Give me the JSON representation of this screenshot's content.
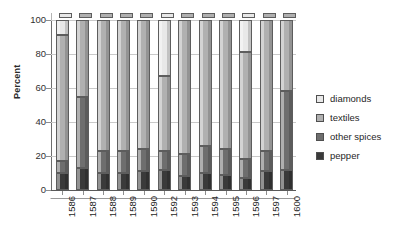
{
  "chart_data": {
    "type": "bar",
    "stacked": true,
    "title": "",
    "xlabel": "",
    "ylabel": "Percent",
    "ylim": [
      0,
      100
    ],
    "yticks": [
      0,
      20,
      40,
      60,
      80,
      100
    ],
    "grid": true,
    "legend_position": "right",
    "categories": [
      "1586",
      "1587",
      "1588",
      "1589",
      "1590",
      "1592",
      "1593",
      "1594",
      "1595",
      "1596",
      "1597",
      "1600"
    ],
    "series": [
      {
        "name": "pepper",
        "color": "#3a3a3a",
        "values": [
          10,
          13,
          10,
          10,
          11,
          12,
          8,
          10,
          9,
          7,
          11,
          12
        ]
      },
      {
        "name": "other spices",
        "color": "#6e6e6e",
        "values": [
          7,
          42,
          13,
          13,
          13,
          11,
          13,
          16,
          15,
          11,
          12,
          46
        ]
      },
      {
        "name": "textiles",
        "color": "#b0b0b0",
        "values": [
          74,
          45,
          77,
          77,
          76,
          44,
          79,
          74,
          76,
          63,
          77,
          42
        ]
      },
      {
        "name": "diamonds",
        "color": "#e8e8e8",
        "values": [
          9,
          0,
          0,
          0,
          0,
          33,
          0,
          0,
          0,
          19,
          0,
          0
        ]
      }
    ]
  },
  "legend": {
    "items": [
      {
        "label": "diamonds",
        "color": "#e8e8e8"
      },
      {
        "label": "textiles",
        "color": "#b0b0b0"
      },
      {
        "label": "other spices",
        "color": "#6e6e6e"
      },
      {
        "label": "pepper",
        "color": "#3a3a3a"
      }
    ]
  },
  "axis": {
    "y_title": "Percent",
    "y_ticks": [
      "0",
      "20",
      "40",
      "60",
      "80",
      "100"
    ]
  }
}
